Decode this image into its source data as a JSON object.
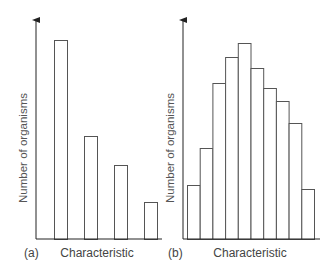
{
  "chart_data": [
    {
      "type": "bar",
      "panel_label": "(a)",
      "title": "",
      "xlabel": "Characteristic",
      "ylabel": "Number of organisms",
      "categories": [
        "1",
        "2",
        "3",
        "4"
      ],
      "values": [
        199,
        103,
        74,
        37
      ],
      "value_units": "relative height (px from baseline, no numeric axis ticks shown)",
      "grid": false,
      "legend": null,
      "notes": "Discontinuous variation: separate bars with gaps"
    },
    {
      "type": "bar",
      "panel_label": "(b)",
      "title": "",
      "xlabel": "Characteristic",
      "ylabel": "Number of organisms",
      "categories": [
        "1",
        "2",
        "3",
        "4",
        "5",
        "6",
        "7",
        "8",
        "9",
        "10"
      ],
      "values": [
        54,
        91,
        156,
        182,
        196,
        171,
        151,
        138,
        116,
        50
      ],
      "value_units": "relative height (px from baseline, no numeric axis ticks shown)",
      "grid": false,
      "legend": null,
      "notes": "Continuous variation: adjacent bars forming a roughly normal distribution"
    }
  ],
  "panels": {
    "a": {
      "label": "(a)",
      "xlabel": "Characteristic",
      "ylabel": "Number of organisms"
    },
    "b": {
      "label": "(b)",
      "xlabel": "Characteristic",
      "ylabel": "Number of organisms"
    }
  },
  "colors": {
    "axis": "#222222",
    "bar_stroke": "#555555",
    "bar_fill": "#ffffff",
    "text": "#444444"
  }
}
